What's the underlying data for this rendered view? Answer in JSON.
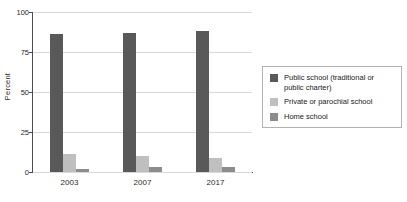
{
  "chart_data": {
    "type": "bar",
    "title": "",
    "xlabel": "",
    "ylabel": "Percent",
    "categories": [
      "2003",
      "2007",
      "2017"
    ],
    "ylim": [
      0,
      100
    ],
    "yticks": [
      0,
      25,
      50,
      75,
      100
    ],
    "ytick_labels": [
      "0",
      "25",
      "50",
      "75",
      "100"
    ],
    "grid": true,
    "legend_position": "right",
    "series": [
      {
        "name": "Public school (traditional or public charter)",
        "color": "#595959",
        "values": [
          86,
          87,
          88
        ]
      },
      {
        "name": "Private or parochial school",
        "color": "#bfbfbf",
        "values": [
          11,
          10,
          9
        ]
      },
      {
        "name": "Home school",
        "color": "#8c8c8c",
        "values": [
          2,
          3,
          3
        ]
      }
    ]
  },
  "legend": {
    "entries": [
      {
        "label": "Public school (traditional or public charter)"
      },
      {
        "label": "Private or parochial school"
      },
      {
        "label": "Home school"
      }
    ]
  }
}
